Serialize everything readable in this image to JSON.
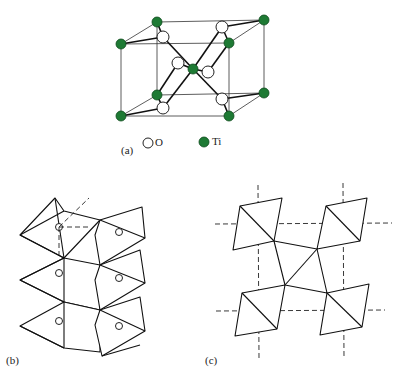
{
  "figure": {
    "panels": [
      {
        "id": "a",
        "label": "(a)",
        "description": "Rutile TiO2 unit cell"
      },
      {
        "id": "b",
        "label": "(b)",
        "description": "Edge-sharing TiO6 octahedra chains"
      },
      {
        "id": "c",
        "label": "(c)",
        "description": "Projection of octahedra along c-axis with dashed cell lines"
      }
    ],
    "legend": {
      "o_label": "O",
      "ti_label": "Ti",
      "o_icon": "open-circle-icon",
      "ti_icon": "filled-green-circle-icon"
    },
    "colors": {
      "ti": "#1e7a34",
      "o": "#ffffff",
      "line": "#222222"
    }
  }
}
